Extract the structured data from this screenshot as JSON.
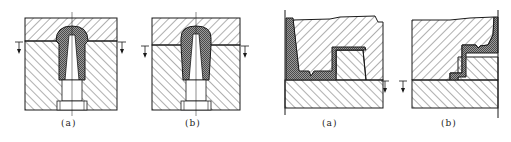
{
  "diagram": {
    "type": "mold-parting-surface-cross-sections",
    "groups": [
      {
        "name": "closed-cap-mold",
        "figures": [
          {
            "id": "fig1a",
            "label": "(a)",
            "description": "Dome part, parting line at base of dome"
          },
          {
            "id": "fig1b",
            "label": "(b)",
            "description": "Dome part, parting line lower at base of cylinder"
          }
        ]
      },
      {
        "name": "stepped-part-mold",
        "figures": [
          {
            "id": "fig2a",
            "label": "(a)",
            "description": "Stepped part, parting line at lower step"
          },
          {
            "id": "fig2b",
            "label": "(b)",
            "description": "Stepped part mirrored, parting line at lower step"
          }
        ]
      }
    ],
    "colors": {
      "line": "#1a1a1a",
      "hatch": "#3a3a3a",
      "part_fill": "#8c8c8c",
      "background": "#ffffff"
    }
  }
}
